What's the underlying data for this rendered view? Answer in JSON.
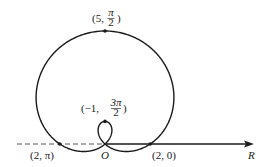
{
  "diagram": {
    "type": "polar-curve",
    "curve": "r = 2 + 3 sin θ (limaçon with inner loop)",
    "origin_label": "O",
    "axis_label": "R",
    "points": [
      {
        "id": "top",
        "label_r": "(5, ",
        "label_theta_num": "π",
        "label_theta_den": "2",
        "label_close": ")"
      },
      {
        "id": "inner",
        "label_r": "(−1, ",
        "label_theta_num": "3π",
        "label_theta_den": "2",
        "label_close": ")"
      },
      {
        "id": "left",
        "label": "(2, π)"
      },
      {
        "id": "right",
        "label": "(2, 0)"
      }
    ],
    "colors": {
      "curve": "#1a1a1a",
      "axis": "#1a1a1a",
      "dashed": "#555555",
      "background": "#ffffff"
    }
  }
}
